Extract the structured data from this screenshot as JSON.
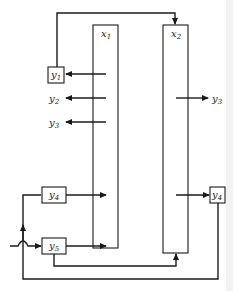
{
  "diagram": {
    "units": [
      {
        "id": "x1",
        "label": "x",
        "subscript": "1"
      },
      {
        "id": "x2",
        "label": "x",
        "subscript": "2"
      }
    ],
    "blocks": [
      {
        "id": "y1",
        "label": "y",
        "subscript": "1"
      },
      {
        "id": "y4_left",
        "label": "y",
        "subscript": "4"
      },
      {
        "id": "y5",
        "label": "y",
        "subscript": "5"
      },
      {
        "id": "y4_right",
        "label": "y",
        "subscript": "4"
      }
    ],
    "outputs": [
      {
        "id": "y2",
        "label": "y",
        "subscript": "2"
      },
      {
        "id": "y3_left",
        "label": "y",
        "subscript": "3"
      },
      {
        "id": "y3_right",
        "label": "y",
        "subscript": "3"
      }
    ],
    "connections": [
      "x1 -> y1",
      "x1 -> y2",
      "x1 -> y3",
      "x2 -> y3",
      "x2 -> y4 (right)",
      "y1 -> x2 (top)",
      "y4 (left) -> x1",
      "y5 -> x1",
      "y5 -> x2 (bottom)",
      "y4 (right) -> y4 (left) (feedback)",
      "feed -> y5"
    ]
  }
}
